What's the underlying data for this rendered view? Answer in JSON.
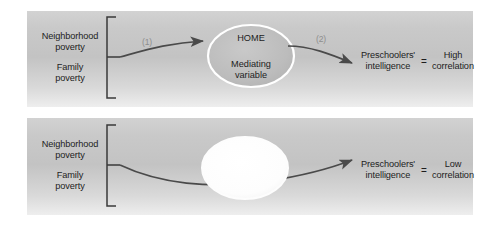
{
  "figure": {
    "background_color": "#ffffff",
    "panel_color": "#c7c7c7"
  },
  "panels": [
    {
      "id": "top",
      "predictor_line1": "Neighborhood",
      "predictor_line2": "poverty",
      "predictor2_line1": "Family",
      "predictor2_line2": "poverty",
      "path1_label": "(1)",
      "path2_label": "(2)",
      "mediator_title": "HOME",
      "mediator_line1": "Mediating",
      "mediator_line2": "variable",
      "outcome_line1": "Preschoolers'",
      "outcome_line2": "intelligence",
      "equals": "=",
      "result_line1": "High",
      "result_line2": "correlation"
    },
    {
      "id": "bottom",
      "predictor_line1": "Neighborhood",
      "predictor_line2": "poverty",
      "predictor2_line1": "Family",
      "predictor2_line2": "poverty",
      "mediator_title": "",
      "mediator_line1": "",
      "mediator_line2": "",
      "outcome_line1": "Preschoolers'",
      "outcome_line2": "intelligence",
      "equals": "=",
      "result_line1": "Low",
      "result_line2": "correlation"
    }
  ],
  "colors": {
    "arrow": "#4a4a4a",
    "bracket": "#3a3a3a",
    "oval_stroke": "#ffffff",
    "oval_fill": "#bdbdbd",
    "oval_empty_fill": "#fbfbfb",
    "faint_label": "#8e8e8e"
  }
}
